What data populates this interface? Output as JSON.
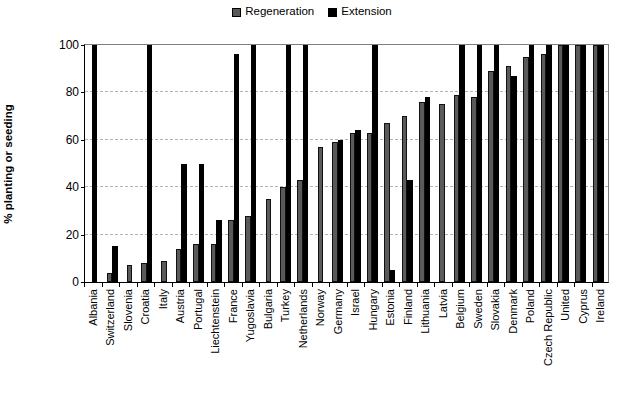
{
  "chart_data": {
    "type": "bar",
    "title": "",
    "subtitle": "",
    "xlabel": "",
    "ylabel": "% planting or seeding",
    "ylim": [
      0,
      100
    ],
    "yticks": [
      0,
      20,
      40,
      60,
      80,
      100
    ],
    "grid": true,
    "legend_position": "top-center",
    "categories": [
      "Albania",
      "Switzerland",
      "Slovenia",
      "Croatia",
      "Italy",
      "Austria",
      "Portugal",
      "Liechtenstein",
      "France",
      "Yugoslavia",
      "Bulgaria",
      "Turkey",
      "Netherlands",
      "Norway",
      "Germany",
      "Israel",
      "Hungary",
      "Estonia",
      "Finland",
      "Lithuania",
      "Latvia",
      "Belgium",
      "Sweden",
      "Slovakia",
      "Denmark",
      "Poland",
      "Czech Republic",
      "United",
      "Cyprus",
      "Ireland"
    ],
    "series": [
      {
        "name": "Regeneration",
        "color": "#5a5a5a",
        "values": [
          0,
          4,
          7,
          8,
          9,
          14,
          16,
          16,
          26,
          28,
          35,
          40,
          43,
          57,
          59,
          63,
          63,
          67,
          70,
          76,
          75,
          79,
          78,
          89,
          91,
          95,
          96,
          100,
          100,
          100
        ]
      },
      {
        "name": "Extension",
        "color": "#000000",
        "values": [
          100,
          15,
          0,
          100,
          0,
          50,
          50,
          26,
          96,
          100,
          0,
          100,
          100,
          0,
          60,
          64,
          100,
          5,
          43,
          78,
          0,
          100,
          100,
          100,
          87,
          100,
          100,
          100,
          100,
          100
        ]
      }
    ]
  },
  "legend": {
    "entries": [
      {
        "label": "Regeneration",
        "swatch": "gray-square-icon"
      },
      {
        "label": "Extension",
        "swatch": "black-square-icon"
      }
    ]
  },
  "axis": {
    "y_title": "% planting or seeding",
    "y_tick_labels": [
      "100",
      "80",
      "60",
      "40",
      "20",
      "0"
    ]
  }
}
